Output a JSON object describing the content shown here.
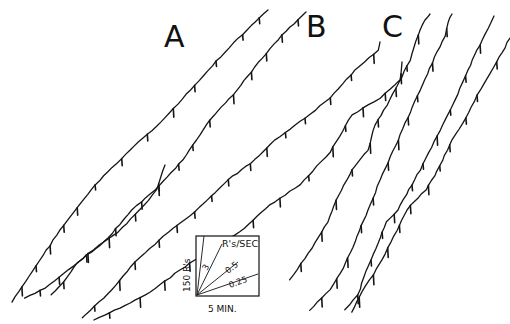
{
  "chart_data": {
    "type": "line",
    "title": "",
    "xlabel": "Time",
    "ylabel": "Cumulative responses",
    "grid": false,
    "legend_position": "none",
    "panels": [
      {
        "label": "A",
        "series": [
          {
            "name": "A1",
            "points": [
              [
                12,
                302
              ],
              [
                60,
                230
              ],
              [
                95,
                185
              ],
              [
                130,
                150
              ],
              [
                165,
                118
              ],
              [
                195,
                85
              ],
              [
                225,
                52
              ],
              [
                247,
                30
              ],
              [
                268,
                10
              ]
            ]
          },
          {
            "name": "A2",
            "points": [
              [
                25,
                298
              ],
              [
                45,
                288
              ],
              [
                78,
                262
              ],
              [
                108,
                238
              ],
              [
                132,
                210
              ],
              [
                155,
                190
              ],
              [
                183,
                160
              ],
              [
                210,
                120
              ],
              [
                237,
                90
              ],
              [
                262,
                58
              ],
              [
                282,
                35
              ],
              [
                306,
                12
              ]
            ]
          },
          {
            "name": "A3",
            "points": [
              [
                51,
                295
              ],
              [
                64,
                282
              ],
              [
                78,
                262
              ],
              [
                100,
                245
              ],
              [
                118,
                232
              ],
              [
                140,
                210
              ],
              [
                157,
                190
              ],
              [
                165,
                165
              ]
            ]
          }
        ]
      },
      {
        "label": "B",
        "series": [
          {
            "name": "B1",
            "points": [
              [
                82,
                318
              ],
              [
                112,
                290
              ],
              [
                135,
                262
              ],
              [
                168,
                232
              ],
              [
                195,
                212
              ],
              [
                228,
                180
              ],
              [
                255,
                160
              ],
              [
                275,
                140
              ],
              [
                305,
                118
              ],
              [
                330,
                98
              ],
              [
                355,
                70
              ],
              [
                378,
                50
              ],
              [
                380,
                42
              ]
            ]
          },
          {
            "name": "B2",
            "points": [
              [
                94,
                320
              ],
              [
                120,
                308
              ],
              [
                150,
                292
              ],
              [
                180,
                270
              ],
              [
                210,
                250
              ],
              [
                240,
                232
              ],
              [
                270,
                205
              ],
              [
                300,
                185
              ],
              [
                330,
                152
              ],
              [
                352,
                115
              ],
              [
                380,
                98
              ],
              [
                400,
                80
              ],
              [
                402,
                62
              ]
            ]
          }
        ]
      },
      {
        "label": "C",
        "series": [
          {
            "name": "C1",
            "points": [
              [
                290,
                280
              ],
              [
                312,
                248
              ],
              [
                328,
                222
              ],
              [
                336,
                200
              ],
              [
                344,
                185
              ],
              [
                352,
                170
              ],
              [
                368,
                150
              ],
              [
                375,
                125
              ],
              [
                390,
                100
              ],
              [
                410,
                60
              ],
              [
                418,
                35
              ],
              [
                425,
                20
              ],
              [
                430,
                14
              ]
            ]
          },
          {
            "name": "C2",
            "points": [
              [
                310,
                310
              ],
              [
                330,
                290
              ],
              [
                343,
                268
              ],
              [
                355,
                242
              ],
              [
                368,
                210
              ],
              [
                380,
                180
              ],
              [
                398,
                140
              ],
              [
                420,
                90
              ],
              [
                437,
                52
              ],
              [
                445,
                36
              ],
              [
                448,
                22
              ],
              [
                452,
                14
              ]
            ]
          },
          {
            "name": "C3",
            "points": [
              [
                345,
                310
              ],
              [
                358,
                295
              ],
              [
                366,
                272
              ],
              [
                376,
                248
              ],
              [
                386,
                222
              ],
              [
                398,
                210
              ],
              [
                420,
                170
              ],
              [
                440,
                130
              ],
              [
                455,
                100
              ],
              [
                468,
                70
              ],
              [
                482,
                40
              ],
              [
                494,
                16
              ]
            ]
          },
          {
            "name": "C4",
            "points": [
              [
                352,
                312
              ],
              [
                362,
                292
              ],
              [
                370,
                280
              ],
              [
                382,
                260
              ],
              [
                394,
                236
              ],
              [
                410,
                205
              ],
              [
                426,
                190
              ],
              [
                440,
                166
              ],
              [
                452,
                140
              ],
              [
                466,
                118
              ],
              [
                480,
                90
              ],
              [
                497,
                62
              ],
              [
                510,
                38
              ]
            ]
          }
        ]
      }
    ],
    "rate_key": {
      "vertical_scale": "150 R's",
      "horizontal_scale": "5 MIN.",
      "rate_unit": "R's/SEC",
      "rates": [
        3,
        0.5,
        0.25
      ]
    }
  },
  "labels": {
    "panel_a": "A",
    "panel_b": "B",
    "panel_c": "C"
  },
  "key": {
    "unit_label": "R's/SEC",
    "y_scale_label": "150 R's",
    "x_scale_label": "5 MIN.",
    "rate_labels": [
      "3",
      "0.5",
      "0.25"
    ]
  }
}
